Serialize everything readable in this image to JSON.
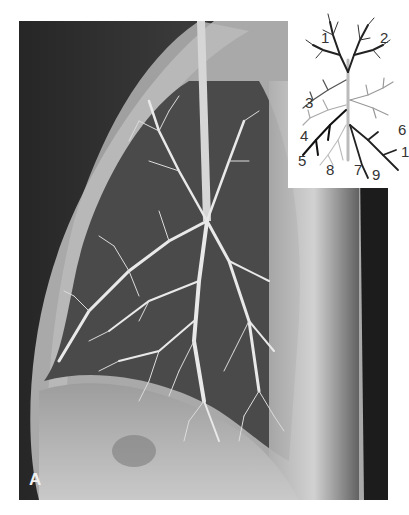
{
  "figure": {
    "panel_label": "A",
    "inset": {
      "description": "Schematic diagram of bronchial tree segments",
      "labels": [
        {
          "text": "1",
          "x": 33,
          "y": 30
        },
        {
          "text": "2",
          "x": 92,
          "y": 30
        },
        {
          "text": "3",
          "x": 17,
          "y": 95
        },
        {
          "text": "4",
          "x": 12,
          "y": 128
        },
        {
          "text": "5",
          "x": 10,
          "y": 153
        },
        {
          "text": "6",
          "x": 110,
          "y": 122
        },
        {
          "text": "8",
          "x": 38,
          "y": 162
        },
        {
          "text": "7",
          "x": 66,
          "y": 162
        },
        {
          "text": "9",
          "x": 84,
          "y": 167
        },
        {
          "text": "1",
          "x": 113,
          "y": 144
        }
      ]
    }
  }
}
